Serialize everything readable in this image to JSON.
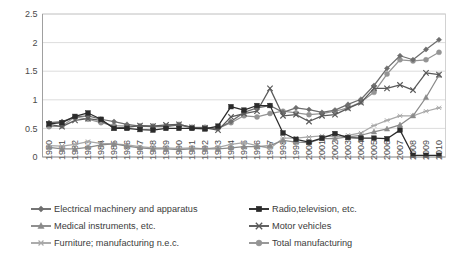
{
  "chart_data": {
    "type": "line",
    "title": "",
    "subtitle": "",
    "xlabel": "",
    "ylabel": "",
    "ylim": [
      0,
      2.5
    ],
    "yticks": [
      "0",
      "0.5",
      "1",
      "1.5",
      "2",
      "2.5"
    ],
    "ytick_values": [
      0,
      0.5,
      1,
      1.5,
      2,
      2.5
    ],
    "grid": "horizontal",
    "legend_position": "bottom",
    "legend_columns": 2,
    "categories": [
      "1980",
      "1981",
      "1982",
      "1983",
      "1984",
      "1985",
      "1986",
      "1987",
      "1988",
      "1989",
      "1990",
      "1991",
      "1992",
      "1993",
      "1994",
      "1995",
      "1996",
      "1997",
      "1998",
      "1999",
      "2000",
      "2001",
      "2002",
      "2003",
      "2004",
      "2005",
      "2006",
      "2007",
      "2008",
      "2009",
      "2010"
    ],
    "series": [
      {
        "name": "Electrical machinery and apparatus",
        "marker": "diamond",
        "color": "#6e6e6e",
        "values": [
          0.6,
          0.62,
          0.7,
          0.72,
          0.66,
          0.62,
          0.57,
          0.54,
          0.53,
          0.53,
          0.56,
          0.51,
          0.5,
          0.5,
          0.62,
          0.78,
          0.86,
          0.9,
          0.78,
          0.86,
          0.83,
          0.78,
          0.82,
          0.92,
          1.01,
          1.25,
          1.55,
          1.77,
          1.7,
          1.88,
          2.05
        ]
      },
      {
        "name": "Radio,television, etc.",
        "marker": "square",
        "color": "#2b2b2b",
        "values": [
          0.58,
          0.6,
          0.71,
          0.77,
          0.66,
          0.5,
          0.5,
          0.48,
          0.47,
          0.5,
          0.5,
          0.5,
          0.49,
          0.54,
          0.88,
          0.82,
          0.9,
          0.9,
          0.42,
          0.31,
          0.26,
          0.33,
          0.41,
          0.34,
          0.33,
          0.33,
          0.32,
          0.47,
          0.03,
          0.03,
          0.03
        ]
      },
      {
        "name": "Medical instruments, etc.",
        "marker": "triangle",
        "color": "#8a8a8a",
        "values": [
          0.17,
          0.14,
          0.14,
          0.17,
          0.21,
          0.23,
          0.19,
          0.16,
          0.14,
          0.14,
          0.13,
          0.14,
          0.14,
          0.14,
          0.16,
          0.18,
          0.18,
          0.2,
          0.29,
          0.26,
          0.25,
          0.32,
          0.32,
          0.35,
          0.38,
          0.44,
          0.49,
          0.56,
          0.72,
          1.04,
          1.43
        ]
      },
      {
        "name": "Motor vehicles",
        "marker": "cross",
        "color": "#5a5a5a",
        "values": [
          0.57,
          0.53,
          0.64,
          0.67,
          0.64,
          0.51,
          0.52,
          0.55,
          0.54,
          0.56,
          0.57,
          0.52,
          0.51,
          0.47,
          0.7,
          0.76,
          0.8,
          1.2,
          0.72,
          0.74,
          0.62,
          0.72,
          0.74,
          0.85,
          0.95,
          1.2,
          1.2,
          1.26,
          1.17,
          1.47,
          1.44
        ]
      },
      {
        "name": "Furniture; manufacturing n.e.c.",
        "marker": "asterisk",
        "color": "#a8a8a8",
        "values": [
          0.2,
          0.19,
          0.22,
          0.27,
          0.24,
          0.23,
          0.21,
          0.18,
          0.16,
          0.16,
          0.15,
          0.16,
          0.14,
          0.17,
          0.22,
          0.25,
          0.2,
          0.15,
          0.33,
          0.33,
          0.35,
          0.37,
          0.35,
          0.38,
          0.42,
          0.55,
          0.64,
          0.72,
          0.72,
          0.8,
          0.86
        ]
      },
      {
        "name": "Total manufacturing",
        "marker": "circle",
        "color": "#949494",
        "values": [
          0.53,
          0.54,
          0.7,
          0.66,
          0.6,
          0.55,
          0.54,
          0.54,
          0.54,
          0.54,
          0.57,
          0.52,
          0.52,
          0.5,
          0.6,
          0.72,
          0.7,
          0.76,
          0.8,
          0.77,
          0.74,
          0.76,
          0.8,
          0.86,
          0.96,
          1.13,
          1.45,
          1.7,
          1.68,
          1.7,
          1.83
        ]
      }
    ]
  },
  "legend": {
    "items": [
      {
        "label": "Electrical machinery and apparatus",
        "marker": "diamond",
        "color": "#6e6e6e"
      },
      {
        "label": "Radio,television, etc.",
        "marker": "square",
        "color": "#2b2b2b"
      },
      {
        "label": "Medical instruments, etc.",
        "marker": "triangle",
        "color": "#8a8a8a"
      },
      {
        "label": "Motor vehicles",
        "marker": "cross",
        "color": "#5a5a5a"
      },
      {
        "label": "Furniture; manufacturing n.e.c.",
        "marker": "asterisk",
        "color": "#a8a8a8"
      },
      {
        "label": "Total manufacturing",
        "marker": "circle",
        "color": "#949494"
      }
    ]
  }
}
